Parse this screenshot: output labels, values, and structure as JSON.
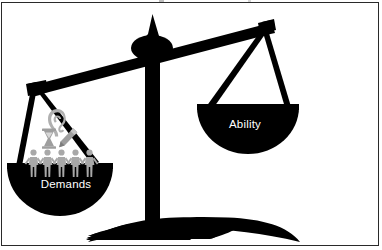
{
  "figure": {
    "type": "balance-scale-diagram",
    "tilt": "left-side-down",
    "background_color": "#ffffff",
    "border_color": "#2a2a2a",
    "scale_color": "#000000",
    "label_color": "#ffffff",
    "icon_color": "#a8a8a8"
  },
  "pans": {
    "left": {
      "label": "Demands",
      "side": "left",
      "state": "lowered",
      "icons": [
        {
          "name": "ear-icon",
          "meaning": "listening"
        },
        {
          "name": "hourglass-icon",
          "meaning": "time"
        },
        {
          "name": "pencil-icon",
          "meaning": "paperwork"
        },
        {
          "name": "people-group-icon",
          "meaning": "people",
          "count": 5
        }
      ]
    },
    "right": {
      "label": "Ability",
      "side": "right",
      "state": "raised",
      "icons": []
    }
  },
  "structure": {
    "beam_name": "scale-beam",
    "fulcrum_name": "scale-fulcrum",
    "post_name": "scale-post",
    "base_name": "scale-base"
  }
}
